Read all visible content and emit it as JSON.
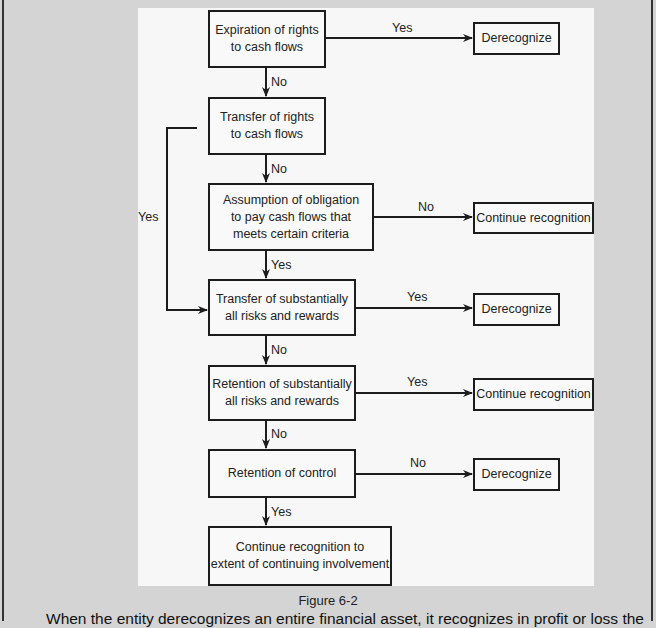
{
  "figure": {
    "caption": "Figure 6-2",
    "nodes": {
      "expiration": "Expiration of rights\nto cash flows",
      "transfer_rights": "Transfer of rights\nto cash flows",
      "assumption": "Assumption of obligation\nto pay cash flows that\nmeets certain criteria",
      "transfer_risks": "Transfer of substantially\nall risks and rewards",
      "retention_risks": "Retention of substantially\nall risks and rewards",
      "retention_control": "Retention of control",
      "continue_extent": "Continue recognition to\nextent of continuing involvement",
      "derecognize_1": "Derecognize",
      "continue_1": "Continue recognition",
      "derecognize_2": "Derecognize",
      "continue_2": "Continue recognition",
      "derecognize_3": "Derecognize"
    },
    "edge_labels": {
      "expiration_yes": "Yes",
      "expiration_no": "No",
      "transfer_rights_no": "No",
      "transfer_rights_yes": "Yes",
      "assumption_no": "No",
      "assumption_yes": "Yes",
      "transfer_risks_yes": "Yes",
      "transfer_risks_no": "No",
      "retention_risks_yes": "Yes",
      "retention_risks_no": "No",
      "retention_control_no": "No",
      "retention_control_yes": "Yes"
    }
  },
  "body_text": "When the entity derecognizes an entire financial asset, it recognizes in profit or loss the"
}
